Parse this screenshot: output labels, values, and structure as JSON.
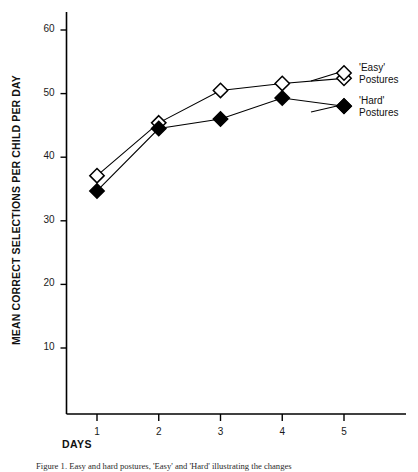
{
  "figure": {
    "caption": "Figure 1.  Easy and hard postures, 'Easy' and 'Hard' illustrating the changes",
    "background_color": "#ffffff",
    "ink_color": "#000000"
  },
  "chart_data": {
    "type": "line",
    "title": "",
    "xlabel": "DAYS",
    "ylabel": "MEAN CORRECT SELECTIONS PER CHILD PER DAY",
    "x": [
      1,
      2,
      3,
      4,
      5
    ],
    "xtick_labels": [
      "1",
      "2",
      "3",
      "4",
      "5"
    ],
    "ytick_labels": [
      "10",
      "20",
      "30",
      "40",
      "50",
      "60"
    ],
    "yticks": [
      10,
      20,
      30,
      40,
      50,
      60
    ],
    "xlim": [
      0.5,
      5.6
    ],
    "ylim": [
      0,
      63
    ],
    "grid": false,
    "legend_position": "right-inside",
    "series": [
      {
        "name": "'Easy' Postures",
        "label_line1": "'Easy'",
        "label_line2": "Postures",
        "marker": "diamond-open",
        "marker_fill": "#ffffff",
        "marker_stroke": "#000000",
        "line_color": "#000000",
        "values": [
          37.1,
          45.4,
          50.5,
          51.6,
          52.4
        ]
      },
      {
        "name": "'Hard' Postures",
        "label_line1": "'Hard'",
        "label_line2": "Postures",
        "marker": "diamond-filled",
        "marker_fill": "#000000",
        "marker_stroke": "#000000",
        "line_color": "#000000",
        "values": [
          34.7,
          44.5,
          46.0,
          49.3,
          48.0
        ]
      }
    ]
  }
}
